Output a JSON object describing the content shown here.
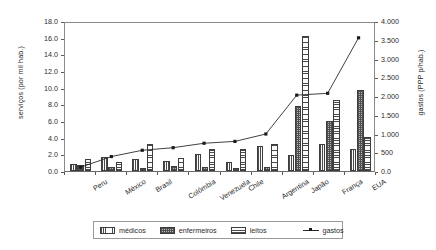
{
  "chart_data": {
    "type": "bar",
    "title": "",
    "subtitle": "",
    "xlabel": "",
    "ylabel": "serviços (por mil hab.)",
    "y2label": "gastos (PPP p/hab.)",
    "categories": [
      "Peru",
      "México",
      "Brasil",
      "Colômbia",
      "Venezuela",
      "Chile",
      "Argentina",
      "Japão",
      "França",
      "EUA"
    ],
    "ylim": [
      0,
      18
    ],
    "y2lim": [
      0,
      4000
    ],
    "yticks": [
      "0.0",
      "2.0",
      "4.0",
      "6.0",
      "8.0",
      "10.0",
      "12.0",
      "14.0",
      "16.0",
      "18.0"
    ],
    "ytick_values": [
      0,
      2,
      4,
      6,
      8,
      10,
      12,
      14,
      16,
      18
    ],
    "y2ticks": [
      "0.0",
      "500",
      "1.000",
      "1.500",
      "2.000",
      "2.500",
      "3.000",
      "3.500",
      "4.000"
    ],
    "y2tick_values": [
      0,
      500,
      1000,
      1500,
      2000,
      2500,
      3000,
      3500,
      4000
    ],
    "grid": false,
    "legend_position": "bottom",
    "series": [
      {
        "name": "médicos",
        "type": "bar",
        "axis": "left",
        "pattern": "vertical-stripes",
        "values": [
          0.9,
          1.7,
          1.4,
          1.2,
          2.0,
          1.1,
          3.0,
          1.9,
          3.3,
          2.7
        ]
      },
      {
        "name": "enfermeiros",
        "type": "bar",
        "axis": "left",
        "pattern": "cross-hatch",
        "values": [
          0.7,
          0.5,
          0.4,
          0.6,
          0.5,
          0.4,
          0.5,
          7.8,
          6.0,
          9.7
        ]
      },
      {
        "name": "leitos",
        "type": "bar",
        "axis": "left",
        "pattern": "horizontal-stripes",
        "values": [
          1.5,
          1.1,
          3.2,
          1.6,
          2.6,
          2.7,
          3.3,
          16.2,
          8.5,
          4.1
        ]
      },
      {
        "name": "gastos",
        "type": "line",
        "axis": "right",
        "marker": "square",
        "values": [
          100,
          390,
          560,
          630,
          750,
          800,
          1000,
          2050,
          2100,
          3600
        ]
      }
    ]
  },
  "legend": {
    "items": [
      {
        "label": "médicos",
        "icon": "vertical-stripe-swatch"
      },
      {
        "label": "enfermeiros",
        "icon": "cross-hatch-swatch"
      },
      {
        "label": "leitos",
        "icon": "horizontal-stripe-swatch"
      },
      {
        "label": "gastos",
        "icon": "line-marker-swatch"
      }
    ]
  }
}
